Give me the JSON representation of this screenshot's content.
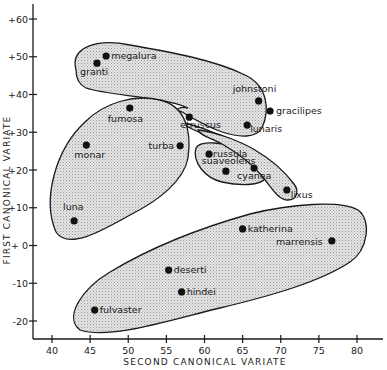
{
  "chart_data": {
    "type": "scatter",
    "title": "",
    "xlabel": "SECOND CANONICAL VARIATE",
    "ylabel": "FIRST CANONICAL VARIATE",
    "xlim": [
      38,
      84
    ],
    "ylim": [
      -25,
      64
    ],
    "grid": false,
    "legend": null,
    "x_ticks": [
      40,
      45,
      50,
      55,
      60,
      65,
      70,
      75,
      80
    ],
    "x_tick_labels": [
      "40",
      "45",
      "50",
      "55",
      "60",
      "65",
      "70",
      "75",
      "80"
    ],
    "y_ticks": [
      60,
      50,
      40,
      30,
      20,
      10,
      0,
      -10,
      -20
    ],
    "y_tick_labels": [
      "+60",
      "+50",
      "+40",
      "+30",
      "+20",
      "+10",
      "+ 0",
      "-10",
      "-20"
    ],
    "points": [
      {
        "name": "megalura",
        "x": 47.1,
        "y": 50.2
      },
      {
        "name": "granti",
        "x": 45.9,
        "y": 48.3
      },
      {
        "name": "johnstoni",
        "x": 67.1,
        "y": 38.3
      },
      {
        "name": "gracilipes",
        "x": 68.6,
        "y": 35.6
      },
      {
        "name": "lunaris",
        "x": 65.6,
        "y": 31.9
      },
      {
        "name": "etruscus",
        "x": 58.0,
        "y": 34.0
      },
      {
        "name": "fumosa",
        "x": 50.2,
        "y": 36.4
      },
      {
        "name": "monar",
        "x": 44.5,
        "y": 26.6
      },
      {
        "name": "turba",
        "x": 56.8,
        "y": 26.4
      },
      {
        "name": "russula",
        "x": 60.6,
        "y": 24.2
      },
      {
        "name": "suaveolens",
        "x": 62.8,
        "y": 19.7
      },
      {
        "name": "cyanea",
        "x": 66.5,
        "y": 20.5
      },
      {
        "name": "lixus",
        "x": 70.8,
        "y": 14.7
      },
      {
        "name": "luna",
        "x": 42.9,
        "y": 6.5
      },
      {
        "name": "katherina",
        "x": 65.0,
        "y": 4.4
      },
      {
        "name": "marrensis",
        "x": 76.7,
        "y": 1.2
      },
      {
        "name": "deserti",
        "x": 55.3,
        "y": -6.5
      },
      {
        "name": "hindei",
        "x": 57.0,
        "y": -12.3
      },
      {
        "name": "fulvaster",
        "x": 45.6,
        "y": -17.1
      }
    ],
    "groups": [
      {
        "id": "upper",
        "members": [
          "megalura",
          "granti",
          "johnstoni",
          "lunaris",
          "etruscus"
        ]
      },
      {
        "id": "left",
        "members": [
          "fumosa",
          "monar",
          "turba",
          "luna"
        ]
      },
      {
        "id": "middle",
        "members": [
          "russula",
          "suaveolens",
          "cyanea"
        ]
      },
      {
        "id": "lixus-tail",
        "members": [
          "lixus"
        ]
      },
      {
        "id": "lower",
        "members": [
          "katherina",
          "marrensis",
          "deserti",
          "hindei",
          "fulvaster"
        ]
      }
    ],
    "annotations": [
      "gracilipes plotted outside enclosed groups"
    ]
  }
}
